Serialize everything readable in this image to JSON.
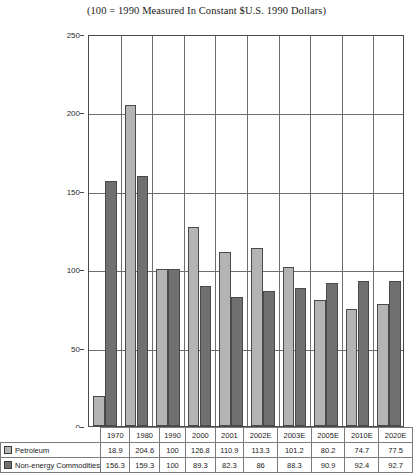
{
  "chart_data": {
    "type": "bar",
    "title": "(100 = 1990 Measured In Constant $U.S. 1990 Dollars)",
    "xlabel": "",
    "ylabel": "",
    "ylim": [
      0,
      250
    ],
    "yticks": [
      0,
      50,
      100,
      150,
      200,
      250
    ],
    "grid": true,
    "legend_position": "bottom-table",
    "categories": [
      "1970",
      "1980",
      "1990",
      "2000",
      "2001",
      "2002E",
      "2003E",
      "2005E",
      "2010E",
      "2020E"
    ],
    "series": [
      {
        "name": "Petroleum",
        "color": "#b4b4b4",
        "values": [
          18.9,
          204.6,
          100,
          126.8,
          110.9,
          113.3,
          101.2,
          80.2,
          74.7,
          77.5
        ]
      },
      {
        "name": "Non-energy Commodities",
        "color": "#707070",
        "values": [
          156.3,
          159.3,
          100,
          89.3,
          82.3,
          86,
          88.3,
          90.9,
          92.4,
          92.7
        ]
      }
    ]
  },
  "table": {
    "row_labels": [
      "Petroleum",
      "Non-energy Commodities"
    ]
  }
}
